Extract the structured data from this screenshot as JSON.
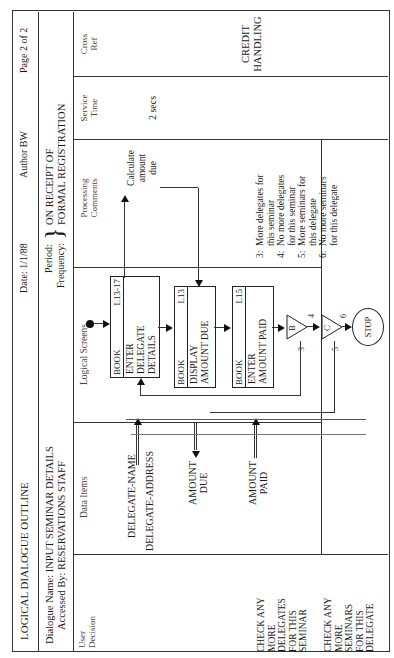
{
  "header": {
    "title": "LOGICAL DIALOGUE OUTLINE",
    "date": "Date: 1/1/88",
    "author": "Author BW",
    "page": "Page 2 of 2",
    "dialogue_name": "Dialogue Name: INPUT SEMINAR DETAILS",
    "accessed_by": "Accessed By: RESERVATIONS STAFF",
    "period_label": "Period:",
    "frequency_label": "Frequency:",
    "brace": "}",
    "period_value_line1": "ON RECEIPT OF",
    "period_value_line2": "FORMAL REGISTRATION"
  },
  "columns": [
    {
      "key": "user_decision",
      "line1": "User",
      "line2": "Decision"
    },
    {
      "key": "data_items",
      "line1": "Data Items",
      "line2": ""
    },
    {
      "key": "logical_screens",
      "line1": "Logical Screens",
      "line2": ""
    },
    {
      "key": "processing_comments",
      "line1": "Processing",
      "line2": "Comments"
    },
    {
      "key": "service_time",
      "line1": "Service",
      "line2": "Time"
    },
    {
      "key": "cross_ref",
      "line1": "Cross",
      "line2": "Ref"
    }
  ],
  "user_decisions": [
    {
      "lines": [
        "CHECK ANY",
        "MORE",
        "DELEGATES",
        "FOR THIS",
        "SEMINAR"
      ]
    },
    {
      "lines": [
        "CHECK ANY",
        "MORE",
        "SEMINARS",
        "FOR THIS",
        "DELEGATE"
      ]
    }
  ],
  "data_items": {
    "delegate_name": "DELEGATE-NAME",
    "delegate_address": "DELEGATE-ADDRESS",
    "amount_due_line1": "AMOUNT",
    "amount_due_line2": "DUE",
    "amount_paid_line1": "AMOUNT",
    "amount_paid_line2": "PAID"
  },
  "screens": [
    {
      "prefix": "BOOK",
      "id": "L13-17",
      "lines": [
        "ENTER",
        "DELEGATE",
        "DETAILS"
      ]
    },
    {
      "prefix": "BOOK",
      "id": "L13",
      "lines": [
        "DISPLAY",
        "AMOUNT DUE"
      ]
    },
    {
      "prefix": "BOOK",
      "id": "L15",
      "lines": [
        "ENTER",
        "AMOUNT PAID"
      ]
    }
  ],
  "decisions": [
    {
      "label": "B",
      "in_label": "3",
      "out_label": "4"
    },
    {
      "label": "C",
      "in_label": "5",
      "out_label": "6"
    }
  ],
  "stop_label": "STOP",
  "processing": {
    "calc_line1": "Calculate",
    "calc_line2": "amount",
    "calc_line3": "due"
  },
  "legend": [
    {
      "num": "3:",
      "line1": "More delegates for",
      "line2": "this seminar"
    },
    {
      "num": "4:",
      "line1": "No more delegates",
      "line2": "for this seminar"
    },
    {
      "num": "5:",
      "line1": "More seminars for",
      "line2": "this delegate"
    },
    {
      "num": "6:",
      "line1": "No more seminars",
      "line2": "for this delegate"
    }
  ],
  "service_time": "2 secs",
  "cross_ref": {
    "line1": "CREDIT",
    "line2": "HANDLING"
  }
}
